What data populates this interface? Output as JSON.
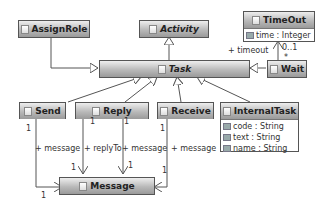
{
  "diagram": {
    "type": "uml-class-diagram",
    "classes": [
      {
        "id": "assignrole",
        "name": "AssignRole",
        "abstract": false,
        "attributes": []
      },
      {
        "id": "activity",
        "name": "Activity",
        "abstract": true,
        "attributes": []
      },
      {
        "id": "timeout",
        "name": "TimeOut",
        "abstract": false,
        "attributes": [
          "time : Integer"
        ]
      },
      {
        "id": "task",
        "name": "Task",
        "abstract": true,
        "attributes": []
      },
      {
        "id": "wait",
        "name": "Wait",
        "abstract": false,
        "attributes": []
      },
      {
        "id": "send",
        "name": "Send",
        "abstract": false,
        "attributes": []
      },
      {
        "id": "reply",
        "name": "Reply",
        "abstract": false,
        "attributes": []
      },
      {
        "id": "receive",
        "name": "Receive",
        "abstract": false,
        "attributes": []
      },
      {
        "id": "internaltask",
        "name": "InternalTask",
        "abstract": false,
        "attributes": [
          "code : String",
          "text : String",
          "name : String"
        ]
      },
      {
        "id": "message",
        "name": "Message",
        "abstract": false,
        "attributes": []
      }
    ],
    "labels": {
      "timeout_role": "+ timeout",
      "timeout_mult_top": "0..1",
      "timeout_mult_bottom": "*",
      "send_role": "+ message",
      "send_mult_src": "1",
      "send_mult_dst": "1",
      "reply_role1": "+ replyTo",
      "reply_role2": "+ message",
      "reply_mult_src1": "1",
      "reply_mult_src2": "1",
      "reply_mult_dst1": "1",
      "reply_mult_dst2": "1",
      "receive_role": "+ message",
      "receive_mult_src": "1",
      "receive_mult_dst": "1"
    }
  }
}
